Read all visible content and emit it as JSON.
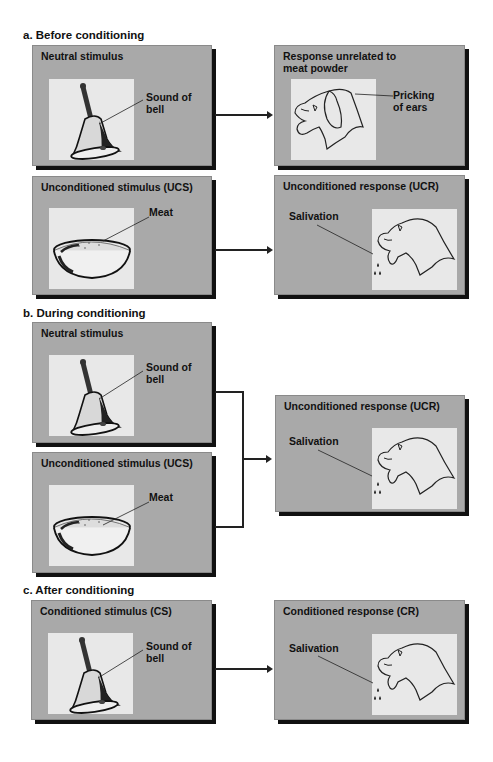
{
  "sections": [
    {
      "id": "a",
      "title": "a. Before conditioning",
      "rows": [
        {
          "left": {
            "title": "Neutral stimulus",
            "image": "bell-icon",
            "label_line1": "Sound of",
            "label_line2": "bell"
          },
          "right": {
            "title_line1": "Response unrelated to",
            "title_line2": "meat powder",
            "image": "dog-head-icon",
            "label_line1": "Pricking",
            "label_line2": "of ears"
          }
        },
        {
          "left": {
            "title": "Unconditioned stimulus (UCS)",
            "image": "meat-bowl-icon",
            "label": "Meat"
          },
          "right": {
            "title": "Unconditioned response (UCR)",
            "image": "salivating-dog-icon",
            "label": "Salivation"
          }
        }
      ]
    },
    {
      "id": "b",
      "title": "b. During conditioning",
      "left_top": {
        "title": "Neutral stimulus",
        "image": "bell-icon",
        "label_line1": "Sound of",
        "label_line2": "bell"
      },
      "left_bottom": {
        "title": "Unconditioned stimulus (UCS)",
        "image": "meat-bowl-icon",
        "label": "Meat"
      },
      "right": {
        "title": "Unconditioned response (UCR)",
        "image": "salivating-dog-icon",
        "label": "Salivation"
      }
    },
    {
      "id": "c",
      "title": "c. After conditioning",
      "left": {
        "title": "Conditioned stimulus (CS)",
        "image": "bell-icon",
        "label_line1": "Sound of",
        "label_line2": "bell"
      },
      "right": {
        "title": "Conditioned response (CR)",
        "image": "salivating-dog-icon",
        "label": "Salivation"
      }
    }
  ],
  "colors": {
    "box_fill": "#a9a9a9",
    "box_shadow": "#111111",
    "picture_bg": "#e8e8e8",
    "line": "#222222"
  }
}
